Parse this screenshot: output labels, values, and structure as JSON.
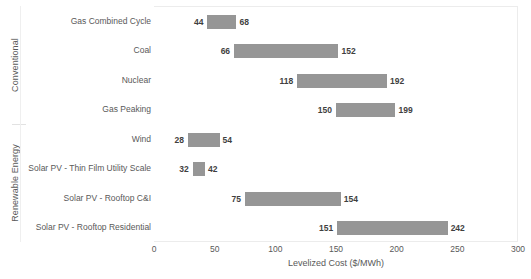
{
  "chart_data": {
    "type": "bar",
    "subtype": "floating-range-bar",
    "title": "",
    "xlabel": "Levelized Cost ($/MWh)",
    "ylabel": "",
    "xlim": [
      0,
      300
    ],
    "xticks": [
      0,
      50,
      100,
      150,
      200,
      250,
      300
    ],
    "xtick_labels": [
      "0",
      "50",
      "100",
      "150",
      "200",
      "250",
      "300"
    ],
    "grid": false,
    "legend": "none",
    "bar_color": "#969696",
    "categories": [
      "Gas Combined Cycle",
      "Coal",
      "Nuclear",
      "Gas Peaking",
      "Wind",
      "Solar PV - Thin Film Utility Scale",
      "Solar PV - Rooftop C&I",
      "Solar PV - Rooftop Residential"
    ],
    "low_values": [
      44,
      66,
      118,
      150,
      28,
      32,
      75,
      151
    ],
    "high_values": [
      68,
      152,
      192,
      199,
      54,
      42,
      154,
      242
    ],
    "groups": [
      {
        "label": "Conventional",
        "categories": [
          "Gas Combined Cycle",
          "Coal",
          "Nuclear",
          "Gas Peaking"
        ]
      },
      {
        "label": "Renewable Energy",
        "categories": [
          "Wind",
          "Solar PV - Thin Film Utility Scale",
          "Solar PV - Rooftop C&I",
          "Solar PV - Rooftop Residential"
        ]
      }
    ],
    "bars": [
      {
        "category": "Gas Combined Cycle",
        "low": 44,
        "high": 68,
        "low_label": "44",
        "high_label": "68"
      },
      {
        "category": "Coal",
        "low": 66,
        "high": 152,
        "low_label": "66",
        "high_label": "152"
      },
      {
        "category": "Nuclear",
        "low": 118,
        "high": 192,
        "low_label": "118",
        "high_label": "192"
      },
      {
        "category": "Gas Peaking",
        "low": 150,
        "high": 199,
        "low_label": "150",
        "high_label": "199"
      },
      {
        "category": "Wind",
        "low": 28,
        "high": 54,
        "low_label": "28",
        "high_label": "54"
      },
      {
        "category": "Solar PV - Thin Film Utility Scale",
        "low": 32,
        "high": 42,
        "low_label": "32",
        "high_label": "42"
      },
      {
        "category": "Solar PV - Rooftop C&I",
        "low": 75,
        "high": 154,
        "low_label": "75",
        "high_label": "154"
      },
      {
        "category": "Solar PV - Rooftop Residential",
        "low": 151,
        "high": 242,
        "low_label": "151",
        "high_label": "242"
      }
    ]
  }
}
